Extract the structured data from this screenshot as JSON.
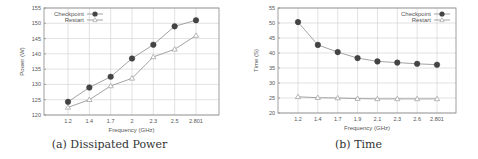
{
  "figures": [
    {
      "id": "a",
      "caption": "(a) Dissipated Power"
    },
    {
      "id": "b",
      "caption": "(b) Time"
    }
  ],
  "chart_data": [
    {
      "type": "line",
      "title": "(a) Dissipated Power",
      "xlabel": "Frequency (GHz)",
      "ylabel": "Power (W)",
      "categories": [
        "1.2",
        "1.4",
        "1.7",
        "2",
        "2.3",
        "2.5",
        "2.801"
      ],
      "ylim": [
        120,
        155
      ],
      "yticks": [
        120,
        125,
        130,
        135,
        140,
        145,
        150,
        155
      ],
      "grid": true,
      "legend_position": "top-left",
      "series": [
        {
          "name": "Checkpoint",
          "marker": "filled-circle",
          "values": [
            124.3,
            129,
            132.5,
            138.5,
            143,
            149,
            151
          ]
        },
        {
          "name": "Restart",
          "marker": "open-triangle",
          "values": [
            122.5,
            125,
            129.5,
            132,
            139,
            141.5,
            146
          ]
        }
      ]
    },
    {
      "type": "line",
      "title": "(b) Time",
      "xlabel": "Frequency (GHz)",
      "ylabel": "Time (S)",
      "categories": [
        "1.2",
        "1.4",
        "1.7",
        "1.9",
        "2.1",
        "2.3",
        "2.6",
        "2.801"
      ],
      "ylim": [
        20,
        55
      ],
      "yticks": [
        20,
        25,
        30,
        35,
        40,
        45,
        50,
        55
      ],
      "grid": true,
      "legend_position": "top-right",
      "series": [
        {
          "name": "Checkpoint",
          "marker": "filled-circle",
          "values": [
            50.3,
            42.7,
            40.3,
            38.3,
            37.2,
            36.8,
            36.4,
            36.1
          ]
        },
        {
          "name": "Restart",
          "marker": "open-triangle",
          "values": [
            25.4,
            25.1,
            25.0,
            24.8,
            24.7,
            24.7,
            24.7,
            24.7
          ]
        }
      ]
    }
  ]
}
